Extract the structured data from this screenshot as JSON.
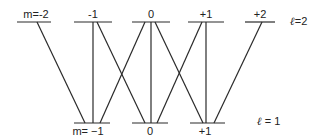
{
  "diagram": {
    "type": "energy-level-transitions",
    "line_color": "#2a2a2a",
    "upper_manifold": {
      "label_symbol": "ℓ",
      "label_value": "=2",
      "y": 22,
      "levels": [
        {
          "m": "m=-2",
          "x1": 17,
          "x2": 51
        },
        {
          "m": "-1",
          "x1": 74,
          "x2": 112
        },
        {
          "m": "0",
          "x1": 132,
          "x2": 170
        },
        {
          "m": "+1",
          "x1": 188,
          "x2": 224
        },
        {
          "m": "+2",
          "x1": 245,
          "x2": 275
        }
      ]
    },
    "lower_manifold": {
      "label_symbol": "ℓ",
      "label_value": " = 1",
      "y": 123,
      "levels": [
        {
          "m": "m= −1",
          "x1": 74,
          "x2": 110
        },
        {
          "m": "0",
          "x1": 132,
          "x2": 168
        },
        {
          "m": "+1",
          "x1": 190,
          "x2": 225
        }
      ]
    },
    "transitions": [
      {
        "from": "m=-2",
        "to": "m=-1",
        "x_top": 37,
        "x_bottom": 85
      },
      {
        "from": "m=-1",
        "to": "m=-1",
        "x_top": 93,
        "x_bottom": 93
      },
      {
        "from": "m=-1",
        "to": "m=0",
        "x_top": 97,
        "x_bottom": 145
      },
      {
        "from": "m=0",
        "to": "m=-1",
        "x_top": 145,
        "x_bottom": 100
      },
      {
        "from": "m=0",
        "to": "m=0",
        "x_top": 151,
        "x_bottom": 151
      },
      {
        "from": "m=0",
        "to": "m=+1",
        "x_top": 155,
        "x_bottom": 203
      },
      {
        "from": "m=+1",
        "to": "m=0",
        "x_top": 202,
        "x_bottom": 157
      },
      {
        "from": "m=+1",
        "to": "m=+1",
        "x_top": 206,
        "x_bottom": 206
      },
      {
        "from": "m=+2",
        "to": "m=+1",
        "x_top": 262,
        "x_bottom": 214
      }
    ]
  }
}
